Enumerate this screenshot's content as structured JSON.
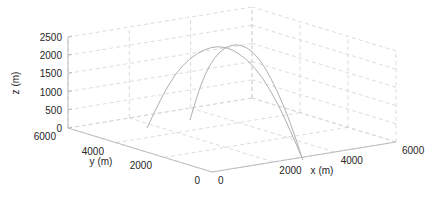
{
  "chart_data": {
    "type": "line3d",
    "title": "",
    "xlabel": "x (m)",
    "ylabel": "y (m)",
    "zlabel": "z (m)",
    "xlim": [
      0,
      6000
    ],
    "ylim": [
      0,
      6000
    ],
    "zlim": [
      0,
      2500
    ],
    "xticks": [
      "0",
      "2000",
      "4000",
      "6000"
    ],
    "yticks": [
      "0",
      "2000",
      "4000",
      "6000"
    ],
    "zticks": [
      "0",
      "500",
      "1000",
      "1500",
      "2000",
      "2500"
    ],
    "grid": true,
    "grid_style": "dashed",
    "series": [
      {
        "name": "trajectory-1",
        "color": "#b0b0b0",
        "points_screen": [
          [
            147,
            128
          ],
          [
            160,
            100
          ],
          [
            175,
            74
          ],
          [
            190,
            58
          ],
          [
            205,
            49
          ],
          [
            218,
            46
          ],
          [
            232,
            49
          ],
          [
            248,
            60
          ],
          [
            263,
            78
          ],
          [
            278,
            104
          ],
          [
            291,
            132
          ],
          [
            303,
            160
          ]
        ]
      },
      {
        "name": "trajectory-2",
        "color": "#b0b0b0",
        "points_screen": [
          [
            190,
            120
          ],
          [
            197,
            96
          ],
          [
            205,
            74
          ],
          [
            214,
            58
          ],
          [
            224,
            48
          ],
          [
            235,
            44
          ],
          [
            247,
            47
          ],
          [
            259,
            58
          ],
          [
            271,
            78
          ],
          [
            283,
            104
          ],
          [
            293,
            130
          ],
          [
            302,
            158
          ]
        ]
      }
    ],
    "colors": {
      "axis": "#bdbdbd",
      "grid": "#d0d0d0",
      "text": "#262626"
    }
  }
}
